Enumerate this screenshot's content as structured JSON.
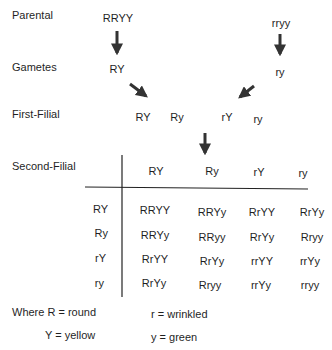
{
  "stages": {
    "parental": "Parental",
    "gametes": "Gametes",
    "first_filial": "First-Filial",
    "second_filial": "Second-Filial"
  },
  "parents": {
    "left": "RRYY",
    "right": "rryy"
  },
  "gametes": {
    "left": "RY",
    "right": "ry"
  },
  "f1_gametes": [
    "RY",
    "Ry",
    "rY",
    "ry"
  ],
  "punnett": {
    "col_headers": [
      "RY",
      "Ry",
      "rY",
      "ry"
    ],
    "row_headers": [
      "RY",
      "Ry",
      "rY",
      "ry"
    ],
    "cells": [
      [
        "RRYY",
        "RRYy",
        "RrYY",
        "RrYy"
      ],
      [
        "RRYy",
        "RRyy",
        "RrYy",
        "Rryy"
      ],
      [
        "RrYY",
        "RrYy",
        "rrYY",
        "rrYy"
      ],
      [
        "RrYy",
        "Rryy",
        "rrYy",
        "rryy"
      ]
    ]
  },
  "legend": {
    "R": "Where R = round",
    "r": "r = wrinkled",
    "Y": "Y = yellow",
    "y": "y = green"
  },
  "colors": {
    "text": "#1f1f1f",
    "arrow": "#333333",
    "line": "#222222"
  }
}
